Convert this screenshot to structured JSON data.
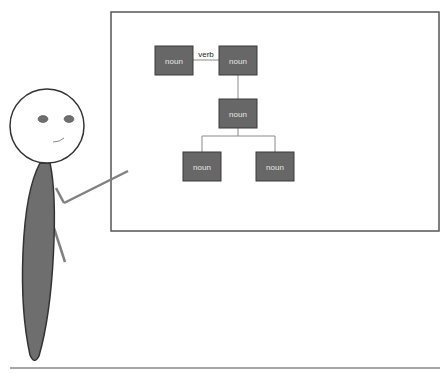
{
  "board": {
    "nodes": [
      {
        "label": "noun",
        "x": 155,
        "y": 46
      },
      {
        "label": "noun",
        "x": 219,
        "y": 46
      },
      {
        "label": "noun",
        "x": 219,
        "y": 99
      },
      {
        "label": "noun",
        "x": 183,
        "y": 152
      },
      {
        "label": "noun",
        "x": 256,
        "y": 152
      }
    ],
    "edge_label": "verb"
  },
  "colors": {
    "node_fill": "#676767",
    "node_stroke": "#3a3a3a",
    "node_text": "#e6e6e6",
    "line": "#8a8a8a",
    "body": "#6e6e6e",
    "outline": "#333333"
  }
}
